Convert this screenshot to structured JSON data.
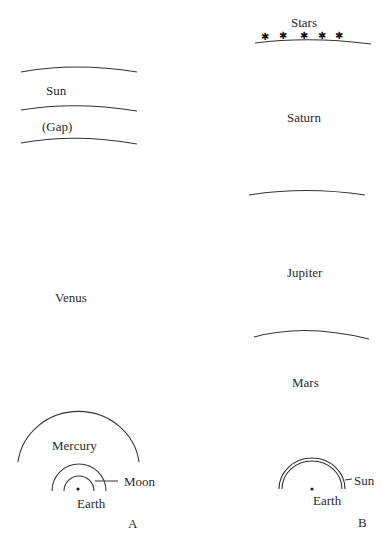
{
  "diagram": {
    "panel_a": {
      "caption": "A",
      "labels": {
        "sun": "Sun",
        "gap": "(Gap)",
        "venus": "Venus",
        "mercury": "Mercury",
        "moon": "Moon",
        "earth": "Earth"
      }
    },
    "panel_b": {
      "caption": "B",
      "labels": {
        "stars": "Stars",
        "saturn": "Saturn",
        "jupiter": "Jupiter",
        "mars": "Mars",
        "sun": "Sun",
        "earth": "Earth"
      },
      "star_count": 5
    }
  }
}
